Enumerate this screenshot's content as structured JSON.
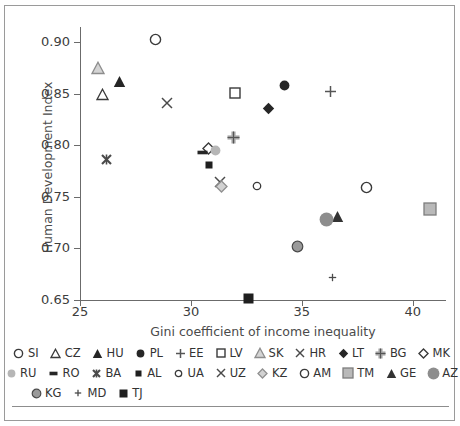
{
  "chart_data": {
    "type": "scatter",
    "title": "",
    "xlabel": "Gini coefficient of income inequality",
    "ylabel": "Human Development Index",
    "xlim": [
      25,
      41.5
    ],
    "ylim": [
      0.65,
      0.915
    ],
    "xticks": [
      "25",
      "30",
      "35",
      "40"
    ],
    "xtick_values": [
      25,
      30,
      35,
      40
    ],
    "yticks": [
      "0.65",
      "0.70",
      "0.75",
      "0.80",
      "0.85",
      "0.90"
    ],
    "ytick_values": [
      0.65,
      0.7,
      0.75,
      0.8,
      0.85,
      0.9
    ],
    "grid": false,
    "legend_position": "bottom",
    "points": [
      {
        "name": "SI",
        "x": 28.4,
        "y": 0.903,
        "marker": "circle-open",
        "color": "#3a3a3a"
      },
      {
        "name": "CZ",
        "x": 26.0,
        "y": 0.849,
        "marker": "triangle-open",
        "color": "#3a3a3a"
      },
      {
        "name": "HU",
        "x": 26.8,
        "y": 0.862,
        "marker": "triangle-filled",
        "color": "#262626"
      },
      {
        "name": "PL",
        "x": 34.2,
        "y": 0.858,
        "marker": "circle-filled",
        "color": "#262626"
      },
      {
        "name": "EE",
        "x": 36.3,
        "y": 0.852,
        "marker": "plus",
        "color": "#555555"
      },
      {
        "name": "LV",
        "x": 32.0,
        "y": 0.851,
        "marker": "square-open",
        "color": "#3a3a3a"
      },
      {
        "name": "SK",
        "x": 25.8,
        "y": 0.875,
        "marker": "triangle-gray",
        "color": "#8d8d8d"
      },
      {
        "name": "HR",
        "x": 28.9,
        "y": 0.841,
        "marker": "x",
        "color": "#4a4a4a"
      },
      {
        "name": "LT",
        "x": 33.5,
        "y": 0.836,
        "marker": "diamond-filled",
        "color": "#262626"
      },
      {
        "name": "BG",
        "x": 31.9,
        "y": 0.808,
        "marker": "plus-bold-gray",
        "color": "#9a9a9a"
      },
      {
        "name": "MK",
        "x": 30.8,
        "y": 0.797,
        "marker": "diamond-open",
        "color": "#3a3a3a"
      },
      {
        "name": "RU",
        "x": 31.1,
        "y": 0.795,
        "marker": "circle-gray",
        "color": "#b6b6b6"
      },
      {
        "name": "RO",
        "x": 30.5,
        "y": 0.793,
        "marker": "dash",
        "color": "#262626"
      },
      {
        "name": "BA",
        "x": 26.2,
        "y": 0.786,
        "marker": "x-bold",
        "color": "#4a4a4a"
      },
      {
        "name": "AL",
        "x": 30.8,
        "y": 0.781,
        "marker": "square-small",
        "color": "#1f1f1f"
      },
      {
        "name": "UZ",
        "x": 31.3,
        "y": 0.765,
        "marker": "x",
        "color": "#4a4a4a"
      },
      {
        "name": "KZ",
        "x": 31.4,
        "y": 0.76,
        "marker": "diamond-gray",
        "color": "#b0b0b0"
      },
      {
        "name": "UA",
        "x": 33.0,
        "y": 0.761,
        "marker": "circle-open-small",
        "color": "#3a3a3a"
      },
      {
        "name": "AM",
        "x": 37.9,
        "y": 0.759,
        "marker": "circle-open",
        "color": "#3a3a3a"
      },
      {
        "name": "TM",
        "x": 40.8,
        "y": 0.738,
        "marker": "square-gray",
        "color": "#9a9a9a"
      },
      {
        "name": "GE",
        "x": 36.6,
        "y": 0.731,
        "marker": "triangle-dark",
        "color": "#333333"
      },
      {
        "name": "AZ",
        "x": 36.1,
        "y": 0.728,
        "marker": "circle-gray-lg",
        "color": "#8d8d8d"
      },
      {
        "name": "KG",
        "x": 34.8,
        "y": 0.702,
        "marker": "circle-gray-ring",
        "color": "#9a9a9a"
      },
      {
        "name": "MD",
        "x": 36.4,
        "y": 0.672,
        "marker": "plus-small",
        "color": "#4a4a4a"
      },
      {
        "name": "TJ",
        "x": 32.6,
        "y": 0.651,
        "marker": "square-dark",
        "color": "#1f1f1f"
      }
    ]
  },
  "legend": {
    "rows": [
      [
        {
          "label": "SI",
          "marker": "circle-open"
        },
        {
          "label": "CZ",
          "marker": "triangle-open"
        },
        {
          "label": "HU",
          "marker": "triangle-filled"
        },
        {
          "label": "PL",
          "marker": "circle-filled"
        },
        {
          "label": "EE",
          "marker": "plus"
        },
        {
          "label": "LV",
          "marker": "square-open"
        },
        {
          "label": "SK",
          "marker": "triangle-gray"
        },
        {
          "label": "HR",
          "marker": "x"
        },
        {
          "label": "LT",
          "marker": "diamond-filled"
        },
        {
          "label": "BG",
          "marker": "plus-bold-gray"
        },
        {
          "label": "MK",
          "marker": "diamond-open"
        }
      ],
      [
        {
          "label": "RU",
          "marker": "circle-gray"
        },
        {
          "label": "RO",
          "marker": "dash"
        },
        {
          "label": "BA",
          "marker": "x-bold"
        },
        {
          "label": "AL",
          "marker": "square-small"
        },
        {
          "label": "UA",
          "marker": "circle-open-small"
        },
        {
          "label": "UZ",
          "marker": "x"
        },
        {
          "label": "KZ",
          "marker": "diamond-gray"
        },
        {
          "label": "AM",
          "marker": "circle-open"
        },
        {
          "label": "TM",
          "marker": "square-gray"
        },
        {
          "label": "GE",
          "marker": "triangle-dark"
        },
        {
          "label": "AZ",
          "marker": "circle-gray-lg"
        }
      ],
      [
        {
          "label": "KG",
          "marker": "circle-gray-ring"
        },
        {
          "label": "MD",
          "marker": "plus-small"
        },
        {
          "label": "TJ",
          "marker": "square-dark"
        }
      ]
    ]
  },
  "colors": {
    "axis": "#6b6b6b",
    "text": "#3d3d3d",
    "frame": "#9a9a9a",
    "background": "#ffffff"
  }
}
